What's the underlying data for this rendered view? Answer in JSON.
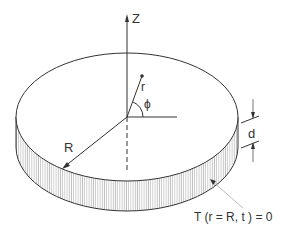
{
  "diagram": {
    "type": "cylindrical disk with coordinate system",
    "labels": {
      "z_axis": "Z",
      "radial_coordinate": "r",
      "azimuth_angle": "ϕ",
      "radius": "R",
      "thickness": "d",
      "boundary_condition": "T (r = R, t ) = 0"
    },
    "colors": {
      "line": "#333333",
      "hatch": "#888888",
      "leader": "#aaaaaa"
    }
  }
}
